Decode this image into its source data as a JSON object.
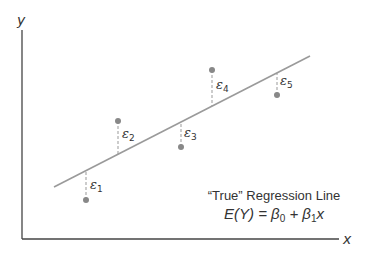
{
  "diagram": {
    "axes": {
      "x_label": "x",
      "y_label": "y",
      "color": "#444444"
    },
    "regression_line": {
      "x1": 54,
      "y1": 187,
      "x2": 310,
      "y2": 56,
      "color": "#9a9a9a"
    },
    "points": [
      {
        "id": "p1",
        "cx": 86,
        "cy": 200,
        "line_y": 171,
        "eps_symbol": "ε",
        "eps_index": "1",
        "label_x": 90,
        "label_y": 189
      },
      {
        "id": "p2",
        "cx": 118,
        "cy": 121,
        "line_y": 154,
        "eps_symbol": "ε",
        "eps_index": "2",
        "label_x": 122,
        "label_y": 138
      },
      {
        "id": "p3",
        "cx": 181,
        "cy": 147,
        "line_y": 122,
        "eps_symbol": "ε",
        "eps_index": "3",
        "label_x": 184,
        "label_y": 137
      },
      {
        "id": "p4",
        "cx": 212,
        "cy": 70,
        "line_y": 106,
        "eps_symbol": "ε",
        "eps_index": "4",
        "label_x": 216,
        "label_y": 89
      },
      {
        "id": "p5",
        "cx": 277,
        "cy": 95,
        "line_y": 73,
        "eps_symbol": "ε",
        "eps_index": "5",
        "label_x": 280,
        "label_y": 85
      }
    ],
    "point_color": "#888888",
    "residual_color": "#999999",
    "caption": {
      "title": "“True” Regression Line",
      "formula_lhs": "E(Y) = ",
      "beta0": "β",
      "beta0_sub": "0",
      "plus": " + ",
      "beta1": "β",
      "beta1_sub": "1",
      "x": "x"
    }
  }
}
